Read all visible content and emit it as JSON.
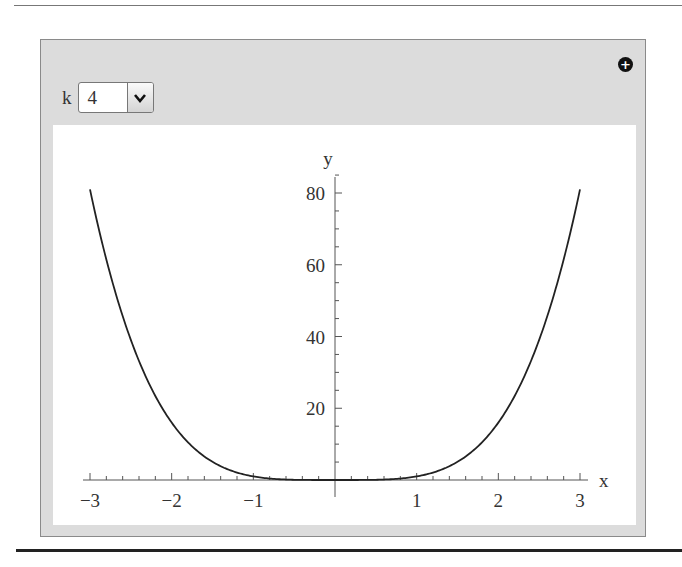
{
  "controls": {
    "parameter_label": "k",
    "parameter_value": "4",
    "dropdown_icon": "chevron-down-icon",
    "add_icon": "plus-circle-icon"
  },
  "chart_data": {
    "type": "line",
    "title": "",
    "function": "y = x^k",
    "k": 4,
    "xlabel": "x",
    "ylabel": "y",
    "xlim": [
      -3,
      3
    ],
    "ylim": [
      0,
      81
    ],
    "x_ticks": [
      -3,
      -2,
      -1,
      1,
      2,
      3
    ],
    "x_tick_labels": [
      "−3",
      "−2",
      "−1",
      "1",
      "2",
      "3"
    ],
    "y_ticks": [
      20,
      40,
      60,
      80
    ],
    "y_tick_labels": [
      "20",
      "40",
      "60",
      "80"
    ],
    "series": [
      {
        "name": "x^4",
        "x": [
          -3,
          -2.5,
          -2,
          -1.5,
          -1,
          -0.5,
          0,
          0.5,
          1,
          1.5,
          2,
          2.5,
          3
        ],
        "y": [
          81,
          39.06,
          16,
          5.06,
          1,
          0.06,
          0,
          0.06,
          1,
          5.06,
          16,
          39.06,
          81
        ]
      }
    ],
    "grid": false,
    "line_color": "#222222"
  }
}
